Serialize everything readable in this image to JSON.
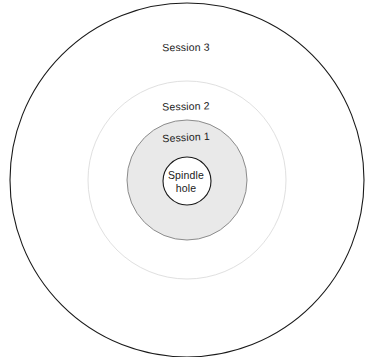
{
  "diagram": {
    "type": "concentric-rings",
    "title_visible": false,
    "canvas": {
      "width": 372,
      "height": 357,
      "background": "#ffffff"
    },
    "center": {
      "x": 187,
      "y": 180
    },
    "colors": {
      "background": "#ffffff",
      "outer_ring_stroke": "#1a1a1a",
      "session2_stroke": "#e0e0e0",
      "session1_stroke": "#8c8c8c",
      "session1_fill": "#e9e9e9",
      "spindle_stroke": "#1a1a1a",
      "spindle_fill": "#ffffff",
      "text": "#1a1a1a"
    },
    "rings": [
      {
        "id": "session-3",
        "label": "Session 3",
        "radius": 177,
        "fill": "#ffffff",
        "stroke": "#1a1a1a",
        "stroke_width": 1.1,
        "label_rotation_deg": -0.6
      },
      {
        "id": "session-2",
        "label": "Session 2",
        "radius": 99,
        "fill": "#ffffff",
        "stroke": "#e0e0e0",
        "stroke_width": 1.0,
        "label_rotation_deg": -1.4
      },
      {
        "id": "session-1",
        "label": "Session 1",
        "radius": 60,
        "fill": "#e9e9e9",
        "stroke": "#8c8c8c",
        "stroke_width": 1.0,
        "label_rotation_deg": -3.2
      },
      {
        "id": "spindle-hole",
        "label": "Spindle hole",
        "label_line_1": "Spindle",
        "label_line_2": "hole",
        "radius": 24,
        "fill": "#ffffff",
        "stroke": "#1a1a1a",
        "stroke_width": 1.1,
        "label_rotation_deg": 0
      }
    ]
  }
}
